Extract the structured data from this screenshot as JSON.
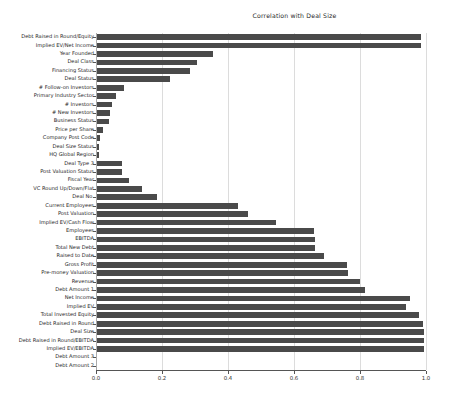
{
  "chart_data": {
    "type": "bar",
    "orientation": "horizontal",
    "title": "Correlation with Deal Size",
    "xlabel": "",
    "ylabel": "",
    "xlim": [
      0.0,
      1.0
    ],
    "xticks": [
      "0.0",
      "0.2",
      "0.4",
      "0.6",
      "0.8",
      "1.0"
    ],
    "xtick_values": [
      0.0,
      0.2,
      0.4,
      0.6,
      0.8,
      1.0
    ],
    "grid": true,
    "legend": null,
    "bar_color": "#4a4a4a",
    "categories": [
      "Debt Raised in Round/Equity",
      "Implied EV/Net Income",
      "Year Founded",
      "Deal Class",
      "Financing Status",
      "Deal Status",
      "# Follow-on Investors",
      "Primary Industry Sector",
      "# Investors",
      "# New Investors",
      "Business Status",
      "Price per Share",
      "Company Post Code",
      "Deal Size Status",
      "HQ Global Region",
      "Deal Type 3",
      "Post Valuation Status",
      "Fiscal Year",
      "VC Round Up/Down/Flat",
      "Deal No.",
      "Current Employees",
      "Post Valuation",
      "Implied EV/Cash Flow",
      "Employees",
      "EBITDA",
      "Total New Debt",
      "Raised to Date",
      "Gross Profit",
      "Pre-money Valuation",
      "Revenue",
      "Debt Amount 1",
      "Net Income",
      "Implied EV",
      "Total Invested Equity",
      "Debt Raised in Round",
      "Deal Size",
      "Debt Raised in Round/EBITDA",
      "Implied EV/EBITDA",
      "Debt Amount 3",
      "Debt Amount 2"
    ],
    "values": [
      0.985,
      0.985,
      0.355,
      0.305,
      0.285,
      0.225,
      0.085,
      0.062,
      0.048,
      0.042,
      0.038,
      0.022,
      0.012,
      0.01,
      0.008,
      0.08,
      0.078,
      0.1,
      0.14,
      0.185,
      0.43,
      0.46,
      0.545,
      0.66,
      0.665,
      0.665,
      0.69,
      0.76,
      0.765,
      0.8,
      0.815,
      0.95,
      0.94,
      0.98,
      0.99,
      0.995,
      0.995,
      0.995,
      0.004,
      0.004
    ]
  }
}
